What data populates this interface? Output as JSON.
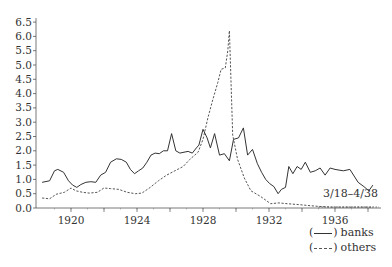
{
  "chart_data": {
    "type": "line",
    "title": "",
    "xlabel": "",
    "ylabel": "",
    "xlim": [
      1918,
      1938.4
    ],
    "ylim": [
      0.0,
      6.5
    ],
    "grid": false,
    "x_ticks": [
      1920,
      1924,
      1928,
      1932,
      1936
    ],
    "x_minor_ticks": [
      1922,
      1926,
      1930,
      1934,
      1938
    ],
    "y_ticks": [
      "0.0",
      "0.5",
      "1.0",
      "1.5",
      "2.0",
      "2.5",
      "3.0",
      "3.5",
      "4.0",
      "4.5",
      "5.0",
      "5.5",
      "6.0",
      "6.5"
    ],
    "annotation": "3/18–4/38",
    "legend_position": "bottom-right",
    "series": [
      {
        "name": "banks",
        "style": "solid",
        "x": [
          1918.25,
          1918.7,
          1919.0,
          1919.2,
          1919.55,
          1919.85,
          1920.1,
          1920.35,
          1920.6,
          1920.9,
          1921.2,
          1921.5,
          1921.8,
          1922.1,
          1922.4,
          1922.75,
          1923.05,
          1923.35,
          1923.6,
          1923.85,
          1924.1,
          1924.35,
          1924.6,
          1924.85,
          1925.1,
          1925.35,
          1925.6,
          1925.85,
          1926.1,
          1926.35,
          1926.6,
          1926.85,
          1927.1,
          1927.35,
          1927.6,
          1927.75,
          1928.0,
          1928.25,
          1928.45,
          1928.7,
          1728.0,
          1929.0,
          1929.3,
          1929.6,
          1929.85,
          1930.15,
          1930.45,
          1930.7,
          1931.0,
          1931.3,
          1931.55,
          1931.8,
          1932.05,
          1932.3,
          1932.55,
          1932.75,
          1933.0,
          1933.2,
          1933.45,
          1933.7,
          1933.95,
          1934.2,
          1934.5,
          1934.8,
          1935.1,
          1935.4,
          1935.7,
          1936.0,
          1936.5,
          1936.9,
          1937.4,
          1937.75,
          1938.05,
          1938.3
        ],
        "values": [
          0.9,
          0.95,
          1.3,
          1.35,
          1.25,
          0.95,
          0.8,
          0.72,
          0.82,
          0.9,
          0.92,
          0.9,
          1.15,
          1.25,
          1.6,
          1.72,
          1.7,
          1.6,
          1.35,
          1.2,
          1.3,
          1.4,
          1.6,
          1.85,
          1.92,
          1.9,
          2.0,
          2.0,
          2.6,
          2.0,
          1.92,
          1.95,
          1.98,
          1.92,
          2.1,
          2.2,
          2.75,
          2.45,
          2.1,
          2.6,
          1.9,
          1.85,
          1.9,
          1.65,
          2.4,
          2.45,
          2.8,
          1.85,
          2.05,
          1.55,
          1.25,
          1.0,
          0.85,
          0.75,
          0.5,
          0.65,
          0.72,
          1.45,
          1.2,
          1.45,
          1.35,
          1.6,
          1.25,
          1.3,
          1.4,
          1.15,
          1.4,
          1.35,
          1.3,
          1.35,
          0.9,
          0.75,
          0.6,
          0.8
        ]
      },
      {
        "name": "others",
        "style": "dashed",
        "x": [
          1918.25,
          1918.7,
          1919.1,
          1919.6,
          1920.0,
          1920.3,
          1920.7,
          1921.1,
          1921.6,
          1922.0,
          1922.4,
          1922.9,
          1923.4,
          1923.9,
          1924.3,
          1924.8,
          1925.3,
          1925.8,
          1926.3,
          1926.8,
          1927.2,
          1927.7,
          1928.0,
          1928.3,
          1928.6,
          1928.9,
          1929.1,
          1929.35,
          1929.5,
          1929.6,
          1929.8,
          1930.1,
          1930.5,
          1930.9,
          1931.5,
          1932.1,
          1932.6,
          1933.1,
          1933.8,
          1934.5,
          1935.2,
          1935.8,
          1936.5,
          1937.2,
          1938.3
        ],
        "values": [
          0.35,
          0.32,
          0.48,
          0.55,
          0.7,
          0.6,
          0.55,
          0.52,
          0.55,
          0.7,
          0.68,
          0.65,
          0.55,
          0.5,
          0.52,
          0.72,
          0.95,
          1.15,
          1.3,
          1.45,
          1.7,
          1.95,
          2.4,
          3.15,
          3.8,
          4.4,
          4.85,
          4.9,
          5.5,
          6.2,
          2.55,
          1.7,
          1.05,
          0.6,
          0.4,
          0.15,
          0.18,
          0.15,
          0.12,
          0.08,
          0.05,
          0.03,
          0.03,
          0.03,
          0.03
        ]
      }
    ]
  },
  "legend": {
    "open_paren": "(",
    "close_paren": ")",
    "items": [
      {
        "label": "banks",
        "style": "solid"
      },
      {
        "label": "others",
        "style": "dashed"
      }
    ]
  }
}
